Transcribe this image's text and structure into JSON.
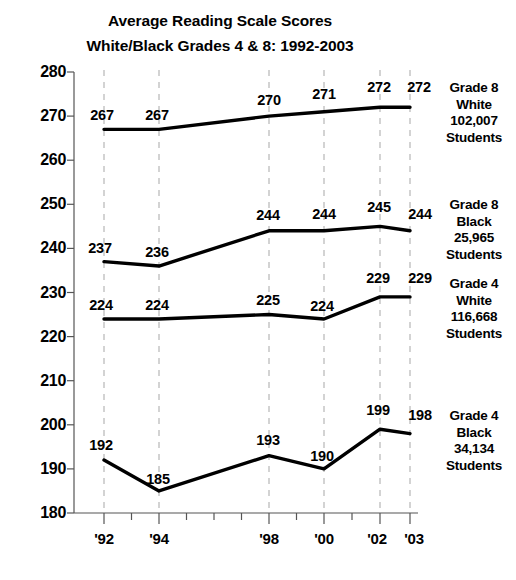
{
  "title": {
    "line1": "Average Reading Scale Scores",
    "line2": "White/Black Grades 4 & 8: 1992-2003"
  },
  "chart_data": {
    "type": "line",
    "title": "Average Reading Scale Scores White/Black Grades 4 & 8: 1992-2003",
    "xlabel": "",
    "ylabel": "",
    "x": [
      1992,
      1994,
      1998,
      2000,
      2002,
      2003
    ],
    "categories": [
      "'92",
      "'94",
      "'98",
      "'00",
      "'02",
      "'03"
    ],
    "xtick_labels": [
      "'92",
      "'94",
      "'98",
      "'00",
      "'02",
      "'03"
    ],
    "ytick_labels": [
      "280",
      "270",
      "260",
      "250",
      "240",
      "230",
      "220",
      "210",
      "200",
      "190",
      "180"
    ],
    "yticks": [
      280,
      270,
      260,
      250,
      240,
      230,
      220,
      210,
      200,
      190,
      180
    ],
    "ylim": [
      180,
      280
    ],
    "grid": "vertical-dashed",
    "legend_position": "right",
    "line_color": "#000000",
    "grid_color": "#b0b0b0",
    "axis_color": "#555555",
    "series": [
      {
        "name": "Grade 8 White",
        "values": [
          267,
          267,
          270,
          271,
          272,
          272
        ],
        "labels": [
          "267",
          "267",
          "270",
          "271",
          "272",
          "272"
        ],
        "legend": {
          "l1": "Grade 8",
          "l2": "White",
          "l3": "102,007",
          "l4": "Students"
        }
      },
      {
        "name": "Grade 8 Black",
        "values": [
          237,
          236,
          244,
          244,
          245,
          244
        ],
        "labels": [
          "237",
          "236",
          "244",
          "244",
          "245",
          "244"
        ],
        "legend": {
          "l1": "Grade 8",
          "l2": "Black",
          "l3": "25,965",
          "l4": "Students"
        }
      },
      {
        "name": "Grade 4 White",
        "values": [
          224,
          224,
          225,
          224,
          229,
          229
        ],
        "labels": [
          "224",
          "224",
          "225",
          "224",
          "229",
          "229"
        ],
        "legend": {
          "l1": "Grade 4",
          "l2": "White",
          "l3": "116,668",
          "l4": "Students"
        }
      },
      {
        "name": "Grade 4 Black",
        "values": [
          192,
          185,
          193,
          190,
          199,
          198
        ],
        "labels": [
          "192",
          "185",
          "193",
          "190",
          "199",
          "198"
        ],
        "legend": {
          "l1": "Grade 4",
          "l2": "Black",
          "l3": "34,134",
          "l4": "Students"
        }
      }
    ]
  }
}
